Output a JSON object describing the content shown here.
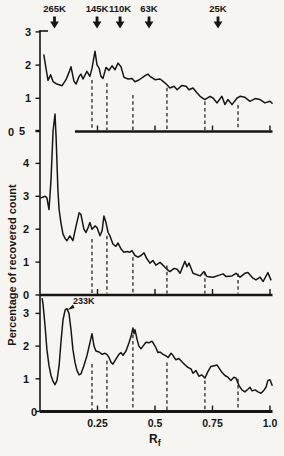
{
  "figure": {
    "ylabel": "Percentage of recovered count",
    "xlabel": "R",
    "xlabel_sub": "f",
    "colors": {
      "ink": "#161616",
      "background": "#f6f5f2"
    }
  },
  "chart_data": {
    "type": "line",
    "xlabel": "Rf",
    "ylabel": "Percentage of recovered count",
    "xlim": [
      0,
      1.0
    ],
    "grid": false,
    "x_ticks": [
      {
        "rf": 0.25,
        "label": "0.25"
      },
      {
        "rf": 0.5,
        "label": "0.5"
      },
      {
        "rf": 0.75,
        "label": "0.75"
      },
      {
        "rf": 1.0,
        "label": "1.0"
      }
    ],
    "molecular_weight_markers": [
      {
        "label": "265K",
        "rf": 0.063
      },
      {
        "label": "145K",
        "rf": 0.248
      },
      {
        "label": "110K",
        "rf": 0.348
      },
      {
        "label": "63K",
        "rf": 0.474
      },
      {
        "label": "25K",
        "rf": 0.774
      }
    ],
    "dashed_line_rf": [
      0.226,
      0.291,
      0.404,
      0.552,
      0.717,
      0.861
    ],
    "panels": [
      {
        "id": "top",
        "ylim": [
          0,
          3
        ],
        "y_ticks": [
          3,
          2,
          1,
          0
        ],
        "baseline_start_rf": 0.152,
        "dash_tops": [
          1.55,
          1.45,
          1.1,
          1.32,
          0.9,
          0.8
        ],
        "points": [
          [
            0.017,
            2.3
          ],
          [
            0.026,
            1.9
          ],
          [
            0.035,
            1.54
          ],
          [
            0.046,
            1.71
          ],
          [
            0.057,
            1.5
          ],
          [
            0.07,
            1.44
          ],
          [
            0.083,
            1.41
          ],
          [
            0.096,
            1.38
          ],
          [
            0.113,
            1.56
          ],
          [
            0.126,
            1.78
          ],
          [
            0.135,
            1.95
          ],
          [
            0.148,
            1.51
          ],
          [
            0.157,
            1.43
          ],
          [
            0.17,
            1.66
          ],
          [
            0.178,
            1.73
          ],
          [
            0.187,
            1.58
          ],
          [
            0.204,
            1.81
          ],
          [
            0.217,
            1.66
          ],
          [
            0.226,
            1.9
          ],
          [
            0.239,
            2.42
          ],
          [
            0.248,
            2.01
          ],
          [
            0.257,
            1.91
          ],
          [
            0.265,
            1.66
          ],
          [
            0.274,
            1.6
          ],
          [
            0.287,
            1.93
          ],
          [
            0.3,
            1.84
          ],
          [
            0.313,
            1.98
          ],
          [
            0.326,
            1.86
          ],
          [
            0.339,
            2.06
          ],
          [
            0.352,
            1.95
          ],
          [
            0.365,
            1.63
          ],
          [
            0.383,
            1.58
          ],
          [
            0.4,
            1.6
          ],
          [
            0.413,
            1.5
          ],
          [
            0.43,
            1.55
          ],
          [
            0.457,
            1.68
          ],
          [
            0.47,
            1.73
          ],
          [
            0.478,
            1.66
          ],
          [
            0.5,
            1.56
          ],
          [
            0.522,
            1.58
          ],
          [
            0.535,
            1.51
          ],
          [
            0.552,
            1.41
          ],
          [
            0.565,
            1.31
          ],
          [
            0.583,
            1.36
          ],
          [
            0.596,
            1.26
          ],
          [
            0.617,
            1.39
          ],
          [
            0.635,
            1.36
          ],
          [
            0.648,
            1.26
          ],
          [
            0.665,
            1.31
          ],
          [
            0.683,
            1.16
          ],
          [
            0.696,
            1.06
          ],
          [
            0.717,
            0.96
          ],
          [
            0.739,
            1.06
          ],
          [
            0.752,
            1.01
          ],
          [
            0.77,
            0.86
          ],
          [
            0.791,
            1.06
          ],
          [
            0.804,
            0.81
          ],
          [
            0.817,
            0.96
          ],
          [
            0.835,
            0.81
          ],
          [
            0.857,
            1.01
          ],
          [
            0.87,
            1.06
          ],
          [
            0.891,
            1.03
          ],
          [
            0.913,
            0.91
          ],
          [
            0.935,
            0.99
          ],
          [
            0.957,
            0.96
          ],
          [
            0.978,
            0.86
          ],
          [
            1.0,
            0.91
          ],
          [
            1.009,
            0.85
          ]
        ]
      },
      {
        "id": "middle",
        "ylim": [
          0,
          5
        ],
        "y_ticks": [
          5,
          4,
          3,
          2,
          1,
          0
        ],
        "baseline_start_rf": 0,
        "dash_tops": [
          1.7,
          1.8,
          1.15,
          0.9,
          0.7,
          0.65
        ],
        "points": [
          [
            0.004,
            2.95
          ],
          [
            0.022,
            3.0
          ],
          [
            0.03,
            2.95
          ],
          [
            0.039,
            2.6
          ],
          [
            0.048,
            3.5
          ],
          [
            0.057,
            5.0
          ],
          [
            0.065,
            5.5
          ],
          [
            0.07,
            4.8
          ],
          [
            0.078,
            3.2
          ],
          [
            0.083,
            2.6
          ],
          [
            0.091,
            2.2
          ],
          [
            0.1,
            1.85
          ],
          [
            0.109,
            1.72
          ],
          [
            0.117,
            1.65
          ],
          [
            0.13,
            1.8
          ],
          [
            0.143,
            1.65
          ],
          [
            0.157,
            2.1
          ],
          [
            0.17,
            2.5
          ],
          [
            0.178,
            2.45
          ],
          [
            0.191,
            2.0
          ],
          [
            0.2,
            1.9
          ],
          [
            0.209,
            2.05
          ],
          [
            0.217,
            2.2
          ],
          [
            0.226,
            2.0
          ],
          [
            0.239,
            2.1
          ],
          [
            0.248,
            2.05
          ],
          [
            0.261,
            1.8
          ],
          [
            0.27,
            1.95
          ],
          [
            0.278,
            2.4
          ],
          [
            0.287,
            2.2
          ],
          [
            0.296,
            1.9
          ],
          [
            0.304,
            1.8
          ],
          [
            0.317,
            1.55
          ],
          [
            0.33,
            1.48
          ],
          [
            0.339,
            1.58
          ],
          [
            0.352,
            1.4
          ],
          [
            0.365,
            1.3
          ],
          [
            0.378,
            1.32
          ],
          [
            0.391,
            1.3
          ],
          [
            0.4,
            1.35
          ],
          [
            0.413,
            1.2
          ],
          [
            0.426,
            1.15
          ],
          [
            0.439,
            1.2
          ],
          [
            0.452,
            1.28
          ],
          [
            0.465,
            1.1
          ],
          [
            0.478,
            0.97
          ],
          [
            0.491,
            1.05
          ],
          [
            0.504,
            0.91
          ],
          [
            0.522,
            0.99
          ],
          [
            0.552,
            0.78
          ],
          [
            0.565,
            0.71
          ],
          [
            0.583,
            0.81
          ],
          [
            0.596,
            0.78
          ],
          [
            0.609,
            0.66
          ],
          [
            0.63,
            1.02
          ],
          [
            0.639,
            0.86
          ],
          [
            0.648,
            0.97
          ],
          [
            0.665,
            0.66
          ],
          [
            0.696,
            0.58
          ],
          [
            0.713,
            0.71
          ],
          [
            0.726,
            0.56
          ],
          [
            0.752,
            0.54
          ],
          [
            0.783,
            0.61
          ],
          [
            0.796,
            0.64
          ],
          [
            0.809,
            0.56
          ],
          [
            0.835,
            0.58
          ],
          [
            0.852,
            0.66
          ],
          [
            0.87,
            0.54
          ],
          [
            0.891,
            0.66
          ],
          [
            0.904,
            0.68
          ],
          [
            0.926,
            0.51
          ],
          [
            0.939,
            0.46
          ],
          [
            0.957,
            0.54
          ],
          [
            0.97,
            0.41
          ],
          [
            0.991,
            0.68
          ],
          [
            1.004,
            0.46
          ]
        ]
      },
      {
        "id": "bottom",
        "ylim": [
          0,
          3
        ],
        "y_ticks": [
          3,
          2,
          1,
          0
        ],
        "baseline_start_rf": 0,
        "dash_tops": [
          1.45,
          1.55,
          2.35,
          1.5,
          0.95,
          1.0
        ],
        "annotation": {
          "label": "233K",
          "rf": 0.143,
          "value": 3.3
        },
        "points": [
          [
            0.009,
            3.45
          ],
          [
            0.013,
            3.3
          ],
          [
            0.022,
            2.6
          ],
          [
            0.03,
            1.9
          ],
          [
            0.039,
            1.4
          ],
          [
            0.048,
            1.1
          ],
          [
            0.057,
            0.92
          ],
          [
            0.065,
            0.82
          ],
          [
            0.074,
            0.95
          ],
          [
            0.083,
            1.4
          ],
          [
            0.091,
            2.1
          ],
          [
            0.1,
            2.8
          ],
          [
            0.109,
            3.1
          ],
          [
            0.117,
            3.15
          ],
          [
            0.126,
            3.0
          ],
          [
            0.135,
            2.5
          ],
          [
            0.143,
            1.9
          ],
          [
            0.152,
            1.5
          ],
          [
            0.161,
            1.25
          ],
          [
            0.17,
            1.12
          ],
          [
            0.178,
            1.15
          ],
          [
            0.191,
            1.4
          ],
          [
            0.204,
            1.7
          ],
          [
            0.217,
            2.1
          ],
          [
            0.226,
            2.38
          ],
          [
            0.235,
            2.0
          ],
          [
            0.243,
            1.85
          ],
          [
            0.257,
            1.82
          ],
          [
            0.27,
            1.75
          ],
          [
            0.283,
            1.78
          ],
          [
            0.291,
            1.75
          ],
          [
            0.3,
            1.65
          ],
          [
            0.309,
            1.5
          ],
          [
            0.317,
            1.45
          ],
          [
            0.33,
            1.6
          ],
          [
            0.343,
            1.75
          ],
          [
            0.352,
            1.8
          ],
          [
            0.361,
            1.72
          ],
          [
            0.374,
            1.85
          ],
          [
            0.387,
            2.1
          ],
          [
            0.396,
            2.3
          ],
          [
            0.404,
            2.55
          ],
          [
            0.409,
            2.38
          ],
          [
            0.413,
            2.5
          ],
          [
            0.422,
            2.2
          ],
          [
            0.43,
            2.0
          ],
          [
            0.439,
            1.92
          ],
          [
            0.448,
            2.0
          ],
          [
            0.461,
            2.12
          ],
          [
            0.474,
            2.1
          ],
          [
            0.487,
            2.15
          ],
          [
            0.496,
            2.05
          ],
          [
            0.504,
            1.95
          ],
          [
            0.513,
            1.8
          ],
          [
            0.522,
            1.82
          ],
          [
            0.535,
            1.75
          ],
          [
            0.548,
            1.7
          ],
          [
            0.557,
            1.65
          ],
          [
            0.57,
            1.78
          ],
          [
            0.578,
            1.72
          ],
          [
            0.591,
            1.58
          ],
          [
            0.604,
            1.62
          ],
          [
            0.617,
            1.52
          ],
          [
            0.63,
            1.43
          ],
          [
            0.643,
            1.35
          ],
          [
            0.657,
            1.3
          ],
          [
            0.665,
            1.17
          ],
          [
            0.678,
            1.25
          ],
          [
            0.691,
            1.08
          ],
          [
            0.704,
            1.12
          ],
          [
            0.717,
            1.02
          ],
          [
            0.73,
            1.22
          ],
          [
            0.743,
            1.38
          ],
          [
            0.757,
            1.4
          ],
          [
            0.77,
            1.42
          ],
          [
            0.783,
            1.28
          ],
          [
            0.791,
            1.2
          ],
          [
            0.804,
            1.1
          ],
          [
            0.817,
            1.05
          ],
          [
            0.83,
            0.95
          ],
          [
            0.843,
            1.05
          ],
          [
            0.852,
            1.02
          ],
          [
            0.865,
            0.8
          ],
          [
            0.878,
            0.66
          ],
          [
            0.891,
            0.6
          ],
          [
            0.904,
            0.68
          ],
          [
            0.913,
            0.74
          ],
          [
            0.922,
            0.63
          ],
          [
            0.935,
            0.66
          ],
          [
            0.948,
            0.6
          ],
          [
            0.961,
            0.56
          ],
          [
            0.974,
            0.65
          ],
          [
            0.983,
            0.75
          ],
          [
            0.991,
            0.95
          ],
          [
            1.0,
            0.97
          ],
          [
            1.009,
            0.8
          ]
        ]
      }
    ]
  }
}
